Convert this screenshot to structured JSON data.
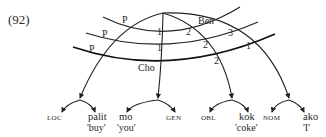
{
  "example_number": "(92)",
  "arc_labels": {
    "p_top": "P",
    "p_mid": "P",
    "p_bot": "P",
    "loc_1": "1",
    "loc_2": "1",
    "cho": "Cho",
    "ben": "Ben",
    "gen_2a": "2",
    "gen_2b": "2",
    "obl_2": "2",
    "nom_3": "3",
    "nom_1": "1"
  },
  "leaves": [
    {
      "case": "LOC",
      "word": "palit",
      "gloss": "'buy'"
    },
    {
      "case": "",
      "word": "mo",
      "gloss": "'you'"
    },
    {
      "case": "GEN",
      "word": "",
      "gloss": ""
    },
    {
      "case": "OBL",
      "word": "kok",
      "gloss": "'coke'"
    },
    {
      "case": "NOM",
      "word": "ako",
      "gloss": "'I'"
    }
  ]
}
